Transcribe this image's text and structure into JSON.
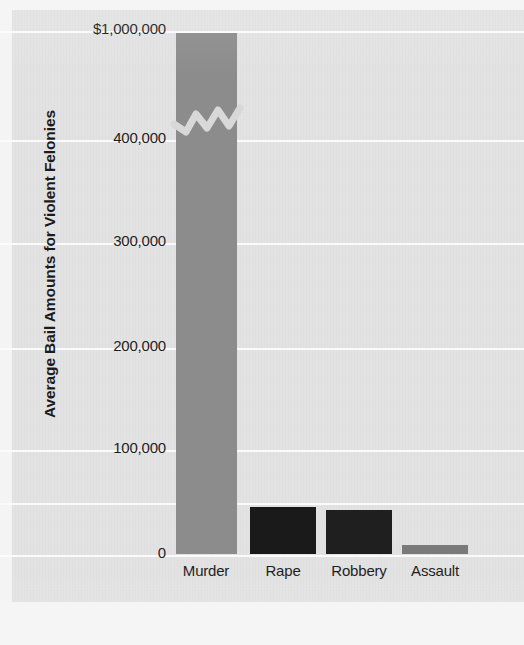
{
  "chart_data": {
    "type": "bar",
    "title": "",
    "subtitle": "",
    "xlabel": "",
    "ylabel": "Average Bail Amounts for Violent Felonies",
    "categories": [
      "Murder",
      "Rape",
      "Robbery",
      "Assault"
    ],
    "values": [
      1000000,
      46000,
      43000,
      9000
    ],
    "series": [
      {
        "name": "Average bail amount",
        "values": [
          1000000,
          46000,
          43000,
          9000
        ]
      }
    ],
    "ylim": [
      0,
      1000000
    ],
    "y_tick_labels": [
      "$1,000,000",
      "400,000",
      "300,000",
      "200,000",
      "100,000",
      "0"
    ],
    "y_tick_values": [
      1000000,
      400000,
      300000,
      200000,
      100000,
      0
    ],
    "axis_break": {
      "present": true,
      "between": [
        400000,
        1000000
      ],
      "style": "zigzag"
    },
    "grid": true,
    "grid_color": "#fbfbfb",
    "legend": "none",
    "annotations": [],
    "bar_colors": [
      "#8c8c8c",
      "#1a1a1a",
      "#1f1f1f",
      "#7a7a7a"
    ],
    "background_color": "#e2e2e2"
  },
  "axis": {
    "y_title": "Average Bail Amounts for Violent Felonies",
    "ticks": [
      {
        "label": "$1,000,000",
        "value": 1000000,
        "y": 31
      },
      {
        "label": "400,000",
        "value": 400000,
        "y": 140
      },
      {
        "label": "300,000",
        "value": 300000,
        "y": 243
      },
      {
        "label": "200,000",
        "value": 200000,
        "y": 348
      },
      {
        "label": "100,000",
        "value": 100000,
        "y": 450
      },
      {
        "label": "",
        "value": 50000,
        "y": 503
      },
      {
        "label": "0",
        "value": 0,
        "y": 555
      }
    ]
  },
  "bars": [
    {
      "label": "Murder",
      "value": 1000000,
      "color": "#8c8c8c",
      "x": 176,
      "width": 61,
      "top": 33,
      "bottom": 554
    },
    {
      "label": "Rape",
      "value": 46000,
      "color": "#1a1a1a",
      "x": 250,
      "width": 66,
      "top": 507,
      "bottom": 554
    },
    {
      "label": "Robbery",
      "value": 43000,
      "color": "#1f1f1f",
      "x": 326,
      "width": 66,
      "top": 510,
      "bottom": 554
    },
    {
      "label": "Assault",
      "value": 9000,
      "color": "#7a7a7a",
      "x": 402,
      "width": 66,
      "top": 545,
      "bottom": 554
    }
  ],
  "x_labels": [
    {
      "text": "Murder",
      "center": 206
    },
    {
      "text": "Rape",
      "center": 283
    },
    {
      "text": "Robbery",
      "center": 359
    },
    {
      "text": "Assault",
      "center": 435
    }
  ]
}
